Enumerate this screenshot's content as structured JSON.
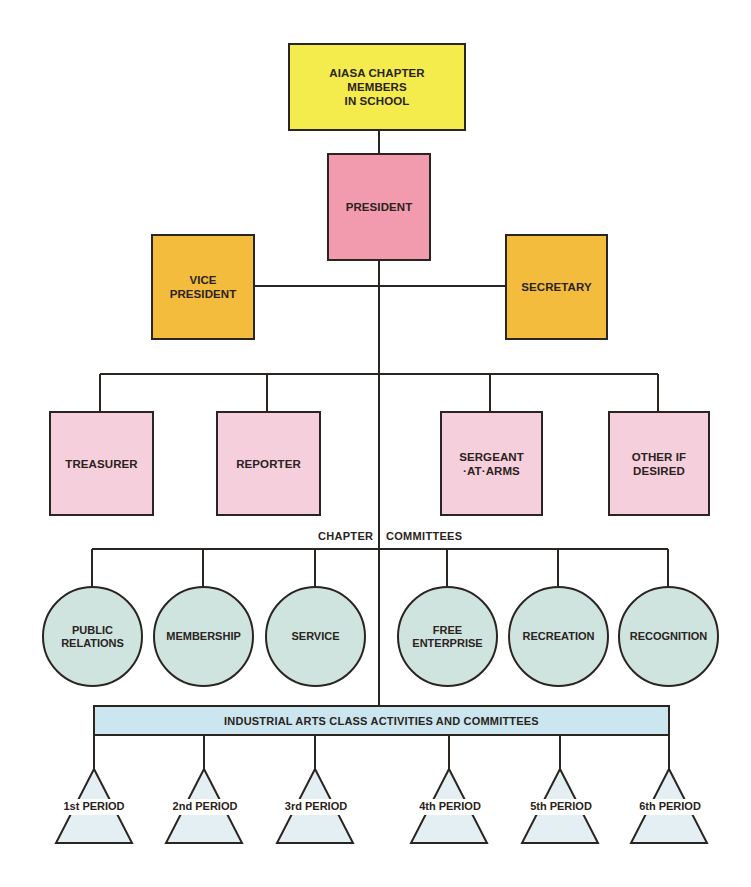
{
  "chart": {
    "top": {
      "label": "AIASA CHAPTER\nMEMBERS\nIN SCHOOL",
      "color": "#f4ec4c"
    },
    "president": {
      "label": "PRESIDENT",
      "color": "#f29aae"
    },
    "second_row": [
      {
        "label": "VICE\nPRESIDENT",
        "color": "#f4bc3c"
      },
      {
        "label": "SECRETARY",
        "color": "#f4bc3c"
      }
    ],
    "officers": [
      {
        "label": "TREASURER"
      },
      {
        "label": "REPORTER"
      },
      {
        "label": "SERGEANT\n·AT·ARMS"
      },
      {
        "label": "OTHER IF\nDESIRED"
      }
    ],
    "committees_heading": {
      "left": "CHAPTER",
      "right": "COMMITTEES"
    },
    "committees": [
      {
        "label": "PUBLIC\nRELATIONS"
      },
      {
        "label": "MEMBERSHIP"
      },
      {
        "label": "SERVICE"
      },
      {
        "label": "FREE\nENTERPRISE"
      },
      {
        "label": "RECREATION"
      },
      {
        "label": "RECOGNITION"
      }
    ],
    "class_bar": {
      "label": "INDUSTRIAL ARTS CLASS ACTIVITIES AND COMMITTEES",
      "color": "#cbe6ef"
    },
    "periods": [
      {
        "label": "1st PERIOD"
      },
      {
        "label": "2nd PERIOD"
      },
      {
        "label": "3rd PERIOD"
      },
      {
        "label": "4th PERIOD"
      },
      {
        "label": "5th PERIOD"
      },
      {
        "label": "6th PERIOD"
      }
    ]
  }
}
